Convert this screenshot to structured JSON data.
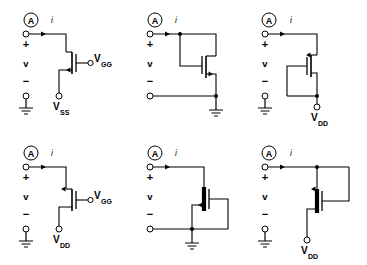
{
  "figure": {
    "background_color": "#ffffff",
    "ink_color": "#000000",
    "rows": 2,
    "columns": 3
  },
  "common": {
    "port_marker": "A",
    "current_label": "i",
    "voltage_label": "v",
    "plus_sign": "+",
    "minus_sign": "−",
    "ground_icon": "ground-icon",
    "terminal_icon": "open-terminal-icon",
    "current_arrow_icon": "current-arrow-icon"
  },
  "circuits": [
    {
      "id": "circuit-1",
      "position": "top-left",
      "port_marker": "A",
      "current_label": "i",
      "voltage_label": "v",
      "plus_sign": "+",
      "minus_sign": "−",
      "device": "nmos-enhancement",
      "gate_side": "right",
      "channel_style": "open",
      "supply_label": "V",
      "supply_sub": "SS",
      "supply_location": "bottom-source",
      "gate_label": "V",
      "gate_sub": "GG",
      "gate_location": "right-terminal",
      "bottom_rail": "ground"
    },
    {
      "id": "circuit-2",
      "position": "top-center",
      "port_marker": "A",
      "current_label": "i",
      "voltage_label": "v",
      "plus_sign": "+",
      "minus_sign": "−",
      "device": "nmos-enhancement",
      "gate_side": "left",
      "channel_style": "open",
      "connection": "diode-connected-gate-to-drain",
      "bottom_rail": "ground"
    },
    {
      "id": "circuit-3",
      "position": "top-right",
      "port_marker": "A",
      "current_label": "i",
      "voltage_label": "v",
      "plus_sign": "+",
      "minus_sign": "−",
      "device": "pmos-enhancement",
      "gate_side": "left",
      "channel_style": "open",
      "connection": "gate-to-source-loop",
      "supply_label": "V",
      "supply_sub": "DD",
      "supply_location": "bottom",
      "bottom_rail": "ground"
    },
    {
      "id": "circuit-4",
      "position": "bottom-left",
      "port_marker": "A",
      "current_label": "i",
      "voltage_label": "v",
      "plus_sign": "+",
      "minus_sign": "−",
      "device": "pmos-enhancement",
      "gate_side": "right",
      "channel_style": "open",
      "gate_label": "V",
      "gate_sub": "GG",
      "gate_location": "right-terminal",
      "supply_label": "V",
      "supply_sub": "DD",
      "supply_location": "bottom-source",
      "bottom_rail": "ground"
    },
    {
      "id": "circuit-5",
      "position": "bottom-center",
      "port_marker": "A",
      "current_label": "i",
      "voltage_label": "v",
      "plus_sign": "+",
      "minus_sign": "−",
      "device": "nmos-depletion",
      "gate_side": "right",
      "channel_style": "solid",
      "connection": "gate-to-source-loop",
      "bottom_rail": "ground"
    },
    {
      "id": "circuit-6",
      "position": "bottom-right",
      "port_marker": "A",
      "current_label": "i",
      "voltage_label": "v",
      "plus_sign": "+",
      "minus_sign": "−",
      "device": "pmos-depletion",
      "gate_side": "right",
      "channel_style": "solid",
      "connection": "gate-to-drain-loop",
      "supply_label": "V",
      "supply_sub": "DD",
      "supply_location": "bottom",
      "bottom_rail": "ground"
    }
  ]
}
